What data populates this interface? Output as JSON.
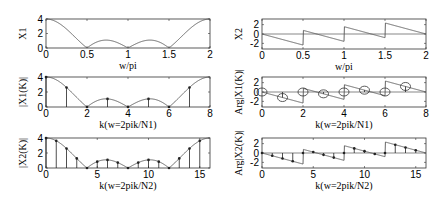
{
  "chart_data": [
    {
      "id": "X1",
      "type": "line",
      "ylabel": "X1",
      "xlabel": "w/pi",
      "xlim": [
        0,
        2
      ],
      "ylim": [
        0,
        4
      ],
      "xticks": [
        0,
        0.5,
        1,
        1.5,
        2
      ],
      "xtick_labels": [
        "0",
        "0.5",
        "1",
        "1.5",
        "2"
      ],
      "yticks": [
        0,
        2,
        4
      ],
      "ytick_labels": [
        "0",
        "2",
        "4"
      ],
      "curve": "abs_dirichlet4",
      "description": "|X1(e^jw)| magnitude of 4-point sequence, max 4 at w=0 and w=2pi, zeros at 0.5,1,1.5"
    },
    {
      "id": "X2",
      "type": "line",
      "ylabel": "X2",
      "xlabel": "w/pi",
      "xlim": [
        0,
        2
      ],
      "ylim": [
        -3.2,
        3.2
      ],
      "xticks": [
        0,
        0.5,
        1,
        1.5,
        2
      ],
      "xtick_labels": [
        "0",
        "0.5",
        "1",
        "1.5",
        "2"
      ],
      "yticks": [
        -2,
        0,
        2
      ],
      "ytick_labels": [
        "-2",
        "0",
        "2"
      ],
      "curve": "phase_dirichlet4",
      "description": "Phase of X1(e^jw), sawtooth with jumps at 0.5,1,1.5"
    },
    {
      "id": "X1K",
      "type": "stem",
      "ylabel": "|X1(K)|",
      "xlabel": "k(w=2pik/N1)",
      "xlim": [
        0,
        8
      ],
      "ylim": [
        0,
        4
      ],
      "xticks": [
        0,
        2,
        4,
        6,
        8
      ],
      "xtick_labels": [
        "0",
        "2",
        "4",
        "6",
        "8"
      ],
      "yticks": [
        0,
        2,
        4
      ],
      "ytick_labels": [
        "0",
        "2",
        "4"
      ],
      "N": 8,
      "k": [
        0,
        1,
        2,
        3,
        4,
        5,
        6,
        7
      ],
      "values": [
        4,
        2.61,
        0,
        1.08,
        0,
        1.08,
        0,
        2.61
      ],
      "envelope": "abs_dirichlet4"
    },
    {
      "id": "ArgX1K",
      "type": "stem",
      "ylabel": "Arg|X1(K)|",
      "xlabel": "k(w=2pik/N1)",
      "xlim": [
        0,
        8
      ],
      "ylim": [
        -3.2,
        3.2
      ],
      "xticks": [
        0,
        2,
        4,
        6,
        8
      ],
      "xtick_labels": [
        "0",
        "2",
        "4",
        "6",
        "8"
      ],
      "yticks": [
        -2,
        0,
        2
      ],
      "ytick_labels": [
        "-2",
        "0",
        "2"
      ],
      "N": 8,
      "k": [
        0,
        1,
        2,
        3,
        4,
        5,
        6,
        7
      ],
      "values": [
        0,
        -1.18,
        0,
        -0.39,
        0,
        0.39,
        0,
        1.18
      ],
      "marker": "circle",
      "envelope": "phase_dirichlet4"
    },
    {
      "id": "X2K",
      "type": "stem",
      "ylabel": "|X2(K)|",
      "xlabel": "k(w=2pik/N2)",
      "xlim": [
        0,
        16
      ],
      "ylim": [
        0,
        4
      ],
      "xticks": [
        0,
        5,
        10,
        15
      ],
      "xtick_labels": [
        "0",
        "5",
        "10",
        "15"
      ],
      "yticks": [
        0,
        2,
        4
      ],
      "ytick_labels": [
        "0",
        "2",
        "4"
      ],
      "N": 16,
      "k": [
        0,
        1,
        2,
        3,
        4,
        5,
        6,
        7,
        8,
        9,
        10,
        11,
        12,
        13,
        14,
        15
      ],
      "values": [
        4,
        3.62,
        2.61,
        1.28,
        0,
        0.85,
        1.08,
        0.72,
        0,
        0.72,
        1.08,
        0.85,
        0,
        1.28,
        2.61,
        3.62
      ],
      "envelope": "abs_dirichlet4"
    },
    {
      "id": "ArgX2K",
      "type": "stem",
      "ylabel": "Arg|X2(K)|",
      "xlabel": "k(w=2pik/N2)",
      "xlim": [
        0,
        16
      ],
      "ylim": [
        -3.2,
        3.2
      ],
      "xticks": [
        0,
        5,
        10,
        15
      ],
      "xtick_labels": [
        "0",
        "5",
        "10",
        "15"
      ],
      "yticks": [
        -2,
        0,
        2
      ],
      "ytick_labels": [
        "-2",
        "0",
        "2"
      ],
      "N": 16,
      "k": [
        0,
        1,
        2,
        3,
        4,
        5,
        6,
        7,
        8,
        9,
        10,
        11,
        12,
        13,
        14,
        15
      ],
      "values": [
        0,
        -0.59,
        -1.18,
        -1.77,
        0,
        0.2,
        -0.39,
        -0.98,
        0,
        0.98,
        0.39,
        -0.2,
        0,
        1.77,
        1.18,
        0.59
      ],
      "envelope": "phase_dirichlet4"
    }
  ],
  "layout": {
    "panels": [
      {
        "x": 46,
        "y": 19,
        "w": 164,
        "h": 29
      },
      {
        "x": 262,
        "y": 19,
        "w": 164,
        "h": 30
      },
      {
        "x": 46,
        "y": 77,
        "w": 164,
        "h": 30
      },
      {
        "x": 262,
        "y": 77,
        "w": 164,
        "h": 30
      },
      {
        "x": 46,
        "y": 138,
        "w": 164,
        "h": 30
      },
      {
        "x": 262,
        "y": 138,
        "w": 164,
        "h": 30
      }
    ],
    "line_color": "#555555",
    "axis_color": "#333333"
  }
}
